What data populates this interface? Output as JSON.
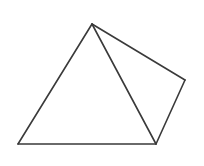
{
  "document": {
    "title": "Pyramid line drawing",
    "background_color": "#ffffff",
    "width": 204,
    "height": 166
  },
  "figure": {
    "name": "square-pyramid-wireframe",
    "description": "Line drawing of a pyramid seen in three-quarter view: a large front triangular face with a smaller right-hand triangular face attached along the shared vertical-ish edge.",
    "stroke_color": "#3a3a3a",
    "fill_color": "#ffffff",
    "stroke_width": 1.6,
    "vertices": {
      "apex": {
        "label": "apex",
        "x": 92,
        "y": 24
      },
      "base_left": {
        "label": "base-left",
        "x": 18,
        "y": 144
      },
      "base_front": {
        "label": "base-front",
        "x": 156,
        "y": 144
      },
      "base_right": {
        "label": "base-right",
        "x": 185,
        "y": 80
      }
    },
    "faces": [
      {
        "name": "front-face",
        "points": "92,24 18,144 156,144"
      },
      {
        "name": "right-face",
        "points": "92,24 185,80 156,144"
      }
    ],
    "edges": [
      {
        "name": "apex-to-base-left",
        "points": "92,24 18,144"
      },
      {
        "name": "base-left-to-base-front",
        "points": "18,144 156,144"
      },
      {
        "name": "base-front-to-apex",
        "points": "156,144 92,24"
      },
      {
        "name": "apex-to-base-right",
        "points": "92,24 185,80"
      },
      {
        "name": "base-right-to-base-front",
        "points": "185,80 156,144"
      }
    ]
  }
}
